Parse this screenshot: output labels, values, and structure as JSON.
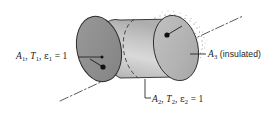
{
  "figure": {
    "type": "technical-line-diagram",
    "background_color": "#ffffff",
    "geometry": {
      "shape": "cylinder",
      "orientation": "oblique, axis running lower-left to upper-right",
      "axis_line_style": "dash-dot centerline extending beyond both ends",
      "left_face": {
        "name": "A1",
        "fill_color": "#8f8f8f",
        "stroke_color": "#2b2b2b",
        "description": "dark gray ellipse, front-facing flat end"
      },
      "lateral_surface": {
        "name": "A3",
        "fill_color": "#c9c9c9",
        "stroke_color": "#2b2b2b",
        "description": "light gray curved side wall with gradient shading"
      },
      "right_face": {
        "name": "A2",
        "fill_color": "#b5b5b5",
        "stroke_color": "#2b2b2b",
        "description": "mid gray ellipse, far flat end, partially hidden, outlined with stipple dots"
      },
      "hidden_edge_style": "dashed arc showing the far rim through the body",
      "stipple": "dotted texture arc around the upper-right rim indicating insulation"
    },
    "labels": [
      {
        "id": "label-a1",
        "name": "surface-1-label",
        "symbol": "A",
        "subscript": "1",
        "text": "A1, T1, ε1 = 1",
        "parts": {
          "area": "A",
          "area_sub": "1",
          "temperature": "T",
          "temperature_sub": "1",
          "emissivity": "ε",
          "emissivity_sub": "1",
          "emissivity_value": "= 1"
        },
        "leader": "horizontal line from label to a dot on the left face"
      },
      {
        "id": "label-a2",
        "name": "surface-2-label",
        "symbol": "A",
        "subscript": "2",
        "text": "A2, T2, ε2 = 1",
        "parts": {
          "area": "A",
          "area_sub": "2",
          "temperature": "T",
          "temperature_sub": "2",
          "emissivity": "ε",
          "emissivity_sub": "2",
          "emissivity_value": "= 1"
        },
        "leader": "elbow leader going up-left to the lower rim of the far face"
      },
      {
        "id": "label-a3",
        "name": "surface-3-label",
        "symbol": "A",
        "subscript": "3",
        "text": "A3 (insulated)",
        "parts": {
          "area": "A",
          "area_sub": "3",
          "note": "(insulated)"
        },
        "leader": "horizontal line from label to the stippled lateral surface"
      }
    ],
    "colors": {
      "line": "#2b2b2b",
      "left_face_fill": "#8f8f8f",
      "right_face_fill": "#b4b4b4",
      "body_fill_light": "#d6d6d6",
      "body_fill_dark": "#b0b0b0",
      "text": "#1a1a1a",
      "stipple": "#6d6d6d"
    }
  }
}
